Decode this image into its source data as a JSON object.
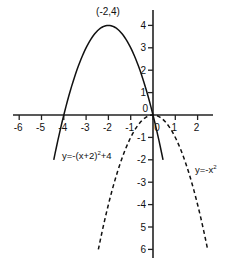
{
  "chart_data": {
    "type": "line",
    "title": "",
    "xlabel": "",
    "ylabel": "",
    "xlim": [
      -6.5,
      3.2
    ],
    "ylim": [
      -6.2,
      4.7
    ],
    "grid": false,
    "x_ticks": [
      -6,
      -5,
      -4,
      -3,
      -2,
      -1,
      0,
      1,
      2
    ],
    "x_tick_labels": [
      "-6",
      "-5",
      "-4",
      "-3",
      "-2",
      "-1",
      "0",
      "1",
      "2"
    ],
    "y_ticks": [
      4,
      3,
      2,
      1,
      0,
      -1,
      -2,
      -3,
      -4,
      -5,
      -6
    ],
    "y_tick_labels": [
      "4",
      "3",
      "2",
      "1",
      "0",
      "-1",
      "-2",
      "-3",
      "-4",
      "5",
      "6"
    ],
    "series": [
      {
        "name": "y=-(x+2)²+4",
        "style": "solid",
        "formula": "-(x+2)^2+4",
        "x_range": [
          -4.45,
          0.45
        ],
        "points": [
          [
            -4.45,
            -2.0
          ],
          [
            -4,
            0
          ],
          [
            -3,
            3
          ],
          [
            -2,
            4
          ],
          [
            -1,
            3
          ],
          [
            0,
            0
          ],
          [
            0.45,
            -2.0
          ]
        ]
      },
      {
        "name": "y=-x²",
        "style": "dashed",
        "formula": "-x^2",
        "x_range": [
          -2.45,
          2.45
        ],
        "points": [
          [
            -2.45,
            -6.0
          ],
          [
            -2,
            -4
          ],
          [
            -1,
            -1
          ],
          [
            0,
            0
          ],
          [
            1,
            -1
          ],
          [
            2,
            -4
          ],
          [
            2.45,
            -6.0
          ]
        ]
      }
    ],
    "annotations": [
      {
        "text": "(-2,4)",
        "x": -2,
        "y": 4,
        "position": "above vertex"
      },
      {
        "label_main": "y=-(x+2)",
        "sup": "2",
        "suffix": "+4",
        "anchor": [
          -3.5,
          -2
        ]
      },
      {
        "label_main": "y=-x",
        "sup": "2",
        "suffix": "",
        "anchor": [
          1.4,
          -3.1
        ]
      }
    ],
    "legend": "none"
  },
  "labels": {
    "vertex": "(-2,4)",
    "curve1_main": "y=-(x+2)",
    "curve1_sup": "2",
    "curve1_suffix": "+4",
    "curve2_main": "y=-x",
    "curve2_sup": "2"
  }
}
